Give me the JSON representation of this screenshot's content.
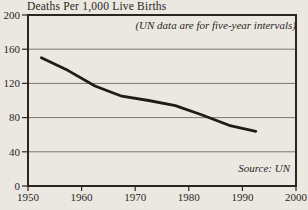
{
  "chart_data": {
    "type": "line",
    "title": "Deaths Per 1,000 Live Births",
    "annotation": "(UN data are for five-year intervals)",
    "source": "Source: UN",
    "x": [
      1952.5,
      1957.5,
      1962.5,
      1967.5,
      1972.5,
      1977.5,
      1982.5,
      1987.5,
      1992.5
    ],
    "values": [
      150,
      135,
      117,
      105,
      100,
      94,
      83,
      71,
      64
    ],
    "xlim": [
      1950,
      2000
    ],
    "ylim": [
      0,
      200
    ],
    "xticks": [
      1950,
      1960,
      1970,
      1980,
      1990,
      2000
    ],
    "yticks": [
      0,
      40,
      80,
      120,
      160,
      200
    ],
    "grid": "horizontal",
    "legend": "none",
    "colors": {
      "background": "#ebe8e1",
      "line": "#211c16",
      "axis": "#2a261f",
      "grid": "#6e6a63",
      "text": "#2a261f"
    }
  }
}
